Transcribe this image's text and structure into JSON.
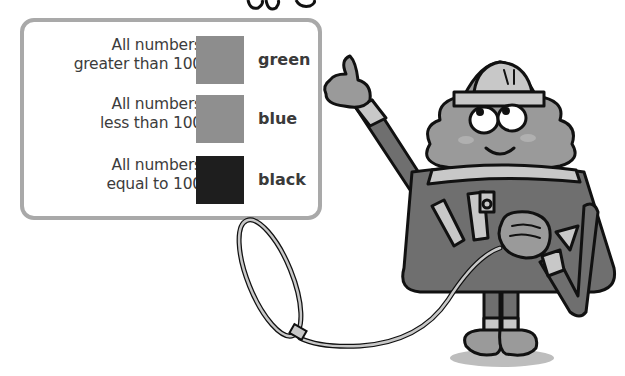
{
  "legend": {
    "rows": [
      {
        "line1": "All numbers",
        "line2": "greater than 100",
        "color_name": "green",
        "swatch_color": "#8d8d8d"
      },
      {
        "line1": "All numbers",
        "line2": "less than 100",
        "color_name": "blue",
        "swatch_color": "#8f8f8f"
      },
      {
        "line1": "All numbers",
        "line2": "equal to 100",
        "color_name": "black",
        "swatch_color": "#1e1e1e"
      }
    ],
    "border_color": "#a9a9a9"
  },
  "illustration": {
    "subject": "cartoon triangle character in hard hat holding a lasso",
    "body_color": "#6f6f6f",
    "face_color": "#9a9a9a",
    "light_color": "#c8c8c8"
  }
}
